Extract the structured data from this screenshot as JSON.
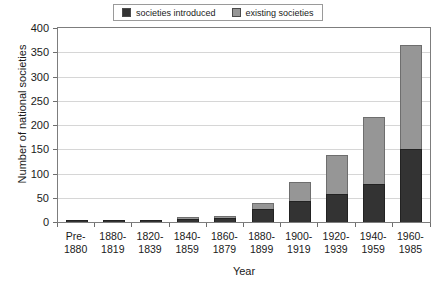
{
  "chart_data": {
    "type": "bar",
    "title": "",
    "subtitle": "",
    "xlabel": "Year",
    "ylabel": "Number of national societies",
    "ylim": [
      0,
      400
    ],
    "ytick_step": 50,
    "yticks": [
      400,
      350,
      300,
      250,
      200,
      150,
      100,
      50,
      0
    ],
    "grid": true,
    "stacked": true,
    "legend_position": "top-center",
    "categories": [
      "Pre-1880",
      "1880-1819",
      "1820-1839",
      "1840-1859",
      "1860-1879",
      "1880-1899",
      "1900-1919",
      "1920-1939",
      "1940-1959",
      "1960-1985"
    ],
    "category_lines": [
      [
        "Pre-",
        "1880"
      ],
      [
        "1880-",
        "1819"
      ],
      [
        "1820-",
        "1839"
      ],
      [
        "1840-",
        "1859"
      ],
      [
        "1860-",
        "1879"
      ],
      [
        "1880-",
        "1899"
      ],
      [
        "1900-",
        "1919"
      ],
      [
        "1920-",
        "1939"
      ],
      [
        "1940-",
        "1959"
      ],
      [
        "1960-",
        "1985"
      ]
    ],
    "series": [
      {
        "name": "societies introduced",
        "color": "#333333",
        "values": [
          1,
          2,
          2,
          6,
          8,
          27,
          43,
          58,
          78,
          150
        ]
      },
      {
        "name": "existing societies",
        "color": "#969696",
        "values": [
          0,
          0,
          0,
          1,
          3,
          12,
          40,
          81,
          138,
          215
        ]
      }
    ],
    "totals": [
      1,
      2,
      2,
      7,
      11,
      39,
      83,
      139,
      216,
      365
    ]
  },
  "legend": {
    "entries": [
      {
        "label": "societies introduced",
        "color": "#333333"
      },
      {
        "label": "existing societies",
        "color": "#969696"
      }
    ]
  },
  "axes": {
    "y_title": "Number of national societies",
    "x_title": "Year"
  }
}
